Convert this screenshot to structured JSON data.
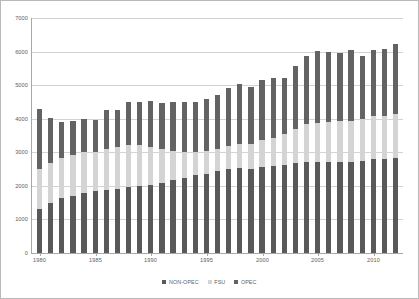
{
  "chart_data": {
    "type": "bar",
    "stacked": true,
    "title": "",
    "subtitle": "",
    "xlabel": "",
    "ylabel": "",
    "ylim": [
      0,
      7000
    ],
    "ytick_step": 1000,
    "ytick_labels": [
      "7000",
      "6000",
      "5000",
      "4000",
      "3000",
      "2000",
      "1000",
      "0"
    ],
    "ytick_values": [
      7000,
      6000,
      5000,
      4000,
      3000,
      2000,
      1000,
      0
    ],
    "grid": true,
    "legend_position": "bottom",
    "x": [
      1980,
      1981,
      1982,
      1983,
      1984,
      1985,
      1986,
      1987,
      1988,
      1989,
      1990,
      1991,
      1992,
      1993,
      1994,
      1995,
      1996,
      1997,
      1998,
      1999,
      2000,
      2001,
      2002,
      2003,
      2004,
      2005,
      2006,
      2007,
      2008,
      2009,
      2010,
      2011,
      2012
    ],
    "categories": [
      "1980",
      "1981",
      "1982",
      "1983",
      "1984",
      "1985",
      "1986",
      "1987",
      "1988",
      "1989",
      "1990",
      "1991",
      "1992",
      "1993",
      "1994",
      "1995",
      "1996",
      "1997",
      "1998",
      "1999",
      "2000",
      "2001",
      "2002",
      "2003",
      "2004",
      "2005",
      "2006",
      "2007",
      "2008",
      "2009",
      "2010",
      "2011",
      "2012"
    ],
    "xtick_labels": [
      "1980",
      "1985",
      "1990",
      "1995",
      "2000",
      "2005",
      "2010"
    ],
    "xtick_values": [
      1980,
      1985,
      1990,
      1995,
      2000,
      2005,
      2010
    ],
    "series": [
      {
        "name": "NON-OPEC",
        "color": "#595959",
        "values": [
          1320,
          1480,
          1620,
          1700,
          1790,
          1840,
          1880,
          1910,
          1960,
          1990,
          2030,
          2080,
          2180,
          2230,
          2300,
          2350,
          2420,
          2490,
          2530,
          2500,
          2560,
          2580,
          2620,
          2680,
          2710,
          2700,
          2700,
          2690,
          2700,
          2740,
          2800,
          2790,
          2830
        ]
      },
      {
        "name": "FSU",
        "color": "#d4d4d4",
        "values": [
          1180,
          1190,
          1200,
          1210,
          1200,
          1160,
          1220,
          1240,
          1250,
          1200,
          1120,
          1010,
          860,
          770,
          700,
          680,
          680,
          690,
          700,
          730,
          780,
          840,
          920,
          1010,
          1110,
          1160,
          1200,
          1230,
          1230,
          1240,
          1270,
          1280,
          1300
        ]
      },
      {
        "name": "OPEC",
        "color": "#636363",
        "values": [
          1760,
          1340,
          1060,
          1000,
          1000,
          940,
          1130,
          1090,
          1260,
          1290,
          1370,
          1370,
          1440,
          1470,
          1490,
          1530,
          1600,
          1710,
          1790,
          1680,
          1800,
          1760,
          1640,
          1860,
          2030,
          2120,
          2070,
          2010,
          2080,
          1870,
          1940,
          1980,
          2080
        ]
      }
    ],
    "totals": [
      4260,
      4010,
      3880,
      3910,
      3990,
      3940,
      4230,
      4240,
      4470,
      4480,
      4520,
      4460,
      4480,
      4470,
      4490,
      4560,
      4700,
      4890,
      5020,
      4910,
      5140,
      5180,
      5180,
      5550,
      5850,
      5980,
      5970,
      5930,
      6010,
      5850,
      6010,
      6050,
      6210
    ],
    "legend": [
      {
        "label": "NON-OPEC",
        "color": "#595959"
      },
      {
        "label": "FSU",
        "color": "#d4d4d4"
      },
      {
        "label": "OPEC",
        "color": "#636363"
      }
    ]
  }
}
